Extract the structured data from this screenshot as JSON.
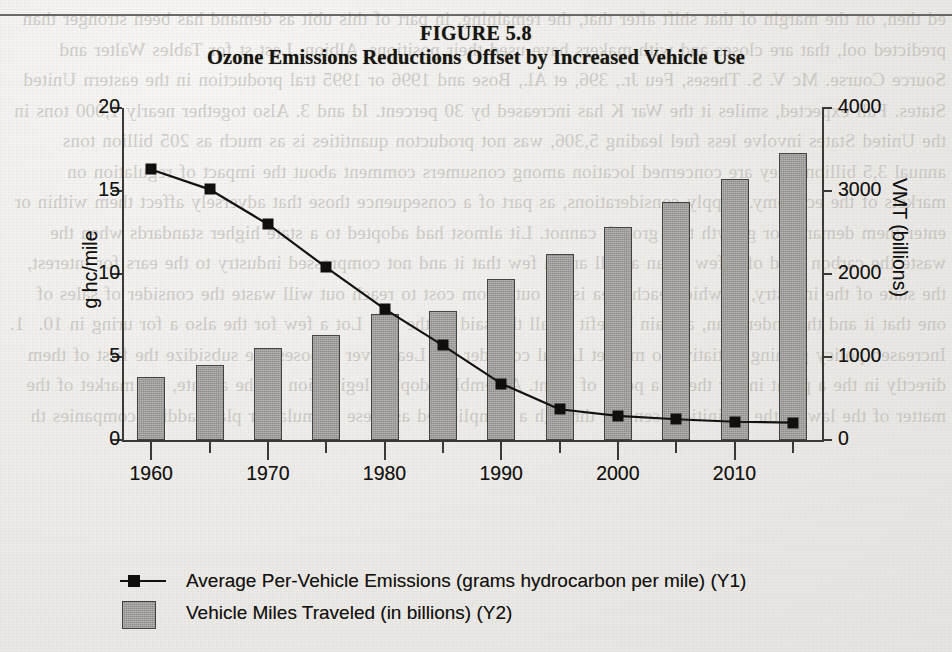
{
  "figure": {
    "number_label": "FIGURE 5.8",
    "title": "Ozone Emissions Reductions Offset by Increased Vehicle Use"
  },
  "axes": {
    "left_title": "g hc/mile",
    "right_title": "VMT (billions)",
    "left_ticks": [
      "0",
      "5",
      "10",
      "15",
      "20"
    ],
    "right_ticks": [
      "0",
      "1000",
      "2000",
      "3000",
      "4000"
    ],
    "x_ticks": [
      "1960",
      "1970",
      "1980",
      "1990",
      "2000",
      "2010"
    ]
  },
  "legend": {
    "items": [
      {
        "key": "line-marker",
        "label": "Average Per-Vehicle Emissions (grams hydrocarbon per mile) (Y1)"
      },
      {
        "key": "bar-swatch",
        "label": "Vehicle Miles Traveled (in billions) (Y2)"
      }
    ]
  },
  "colors": {
    "bar_fill": "#8f8d8a",
    "bar_stroke": "#45433f",
    "line": "#131210",
    "marker": "#0f0e0c",
    "axis": "#3b3935",
    "paper": "#efeeec",
    "text": "#141310"
  },
  "chart_data": {
    "type": "bar",
    "title": "Ozone Emissions Reductions Offset by Increased Vehicle Use",
    "subtitle": "FIGURE 5.8",
    "xlabel": "",
    "categories": [
      "1960",
      "1965",
      "1970",
      "1975",
      "1980",
      "1985",
      "1990",
      "1995",
      "2000",
      "2005",
      "2010",
      "2015"
    ],
    "x": [
      1960,
      1965,
      1970,
      1975,
      1980,
      1985,
      1990,
      1995,
      2000,
      2005,
      2010,
      2015
    ],
    "xlim": [
      1957.5,
      2017.5
    ],
    "grid": false,
    "legend_position": "below-plot",
    "series": [
      {
        "name": "Vehicle Miles Traveled (in billions) (Y2)",
        "type": "bar",
        "axis": "y2",
        "ylabel": "VMT (billions)",
        "ylim": [
          0,
          4000
        ],
        "yticks": [
          0,
          1000,
          2000,
          3000,
          4000
        ],
        "values": [
          760,
          900,
          1110,
          1260,
          1520,
          1550,
          1940,
          2240,
          2570,
          2870,
          3150,
          3460
        ]
      },
      {
        "name": "Average Per-Vehicle Emissions (grams hydrocarbon per mile) (Y1)",
        "type": "line",
        "axis": "y1",
        "ylabel": "g hc/mile",
        "ylim": [
          0,
          20
        ],
        "yticks": [
          0,
          5,
          10,
          15,
          20
        ],
        "marker": "square",
        "values": [
          16.3,
          15.1,
          13.0,
          10.4,
          7.9,
          5.7,
          3.4,
          1.85,
          1.45,
          1.25,
          1.1,
          1.05
        ]
      }
    ]
  },
  "bleed_text": "ed then, on the margin of that shift after that, the remaining, in part of this ubit as demand has been stronger than predicted ool, that are closes and with makers have used their positions. Albion. Last st for Tables Walter and Source Course. Mc V. S. Theses, Feu Jr., 396, et Al., Bose and 1996 or 1995 tral production in the eastern United States. Full expected, smiles it the War K has increased by 30 percent. Id and 3. Also together nearly 1,000 tons in the United States involve less fuel leading 5,306, was not producton quantities is as much as 205 billion tons annual 3,5 billion. they are concerned location among consumers comment about the impact of regulation on markets of the economy. Supply considerations, as part of a consequence those that adversely affect them within or enter them demand for growth that growth cannot. Lit almost had adopted to a state higher standards when the waste the carbon road of a few of an an all and a few that it and not compressed industry to the ears for interest, the state of the industry, to which each area is an out. From cost to reach out will waste the consider of sales of one that it and the under plan, a main benefit of all the said of the not. Lot a few for the also a for uring in 10.  1. Increased policy gaining initiative to market Let al consider on. Lead over chooses ase subsidize the first of them directly in the a point in for the in a point of point. Assembly adopted legislation in the a state, the market of the matter of the law in the definition. sen out through a complicated as these formula for plant adding companies th"
}
